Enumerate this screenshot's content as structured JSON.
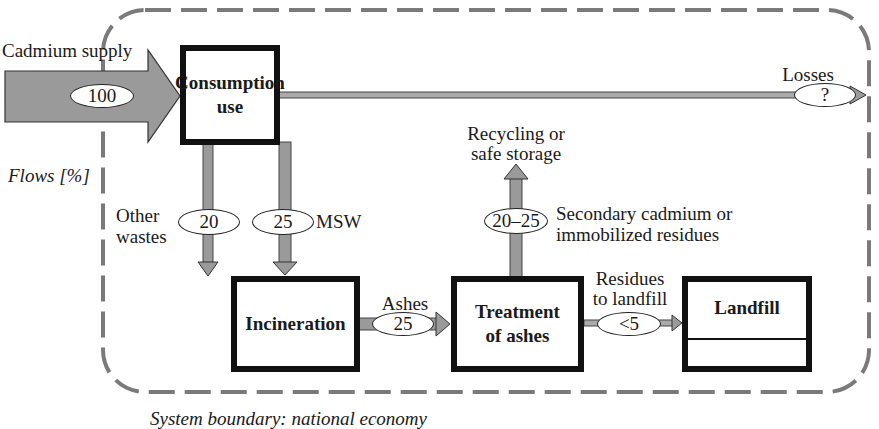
{
  "diagram": {
    "flows_label": "Flows [%]",
    "system_boundary_caption": "System boundary: national economy",
    "colors": {
      "arrow_fill": "#9a9a9a",
      "boundary_dash": "#7a7a7a",
      "box_border": "#111111"
    },
    "nodes": {
      "consumption": {
        "line1": "Consumption",
        "line2": "use"
      },
      "incineration": {
        "label": "Incineration"
      },
      "treatment": {
        "line1": "Treatment",
        "line2": "of ashes"
      },
      "landfill": {
        "label": "Landfill"
      }
    },
    "flows": {
      "supply": {
        "label": "Cadmium supply",
        "value": "100"
      },
      "losses": {
        "label": "Losses",
        "value": "?"
      },
      "other_wastes": {
        "line1": "Other",
        "line2": "wastes",
        "value": "20"
      },
      "msw": {
        "label": "MSW",
        "value": "25"
      },
      "ashes": {
        "label": "Ashes",
        "value": "25"
      },
      "recycling": {
        "line1": "Recycling or",
        "line2": "safe storage",
        "value": "20–25",
        "desc1": "Secondary cadmium or",
        "desc2": "immobilized residues"
      },
      "residues": {
        "line1": "Residues",
        "line2": "to landfill",
        "value": "<5"
      }
    }
  }
}
